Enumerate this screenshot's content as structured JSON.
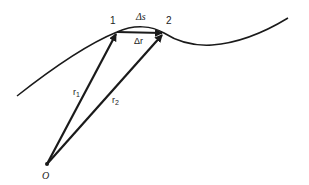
{
  "diagram": {
    "title": "",
    "labels": {
      "point1": "1",
      "point2": "2",
      "arc": "Δs",
      "chord": "Δr",
      "r1_main": "r",
      "r1_sub": "1",
      "r2_main": "r",
      "r2_sub": "2",
      "origin": "O"
    },
    "colors": {
      "ink": "#1a1a1a",
      "background": "#ffffff"
    }
  }
}
